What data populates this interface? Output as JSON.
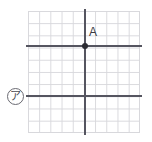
{
  "figure": {
    "grid": {
      "columns": 10,
      "rows": 10,
      "grid_line_color": "#d8d8dc",
      "axis_line_color": "#555560",
      "background": "#ffffff"
    },
    "point": {
      "label": "A",
      "marker_color": "#2b2b32",
      "grid_x": 5,
      "grid_y": 3
    },
    "marker": {
      "label": "ア",
      "description": "circled-katakana-a",
      "row": 7
    },
    "lines": [
      {
        "name": "horizontal-axis-through-point",
        "orientation": "horizontal",
        "grid_y": 3
      },
      {
        "name": "horizontal-line-lower",
        "orientation": "horizontal",
        "grid_y": 7
      },
      {
        "name": "vertical-axis-through-point",
        "orientation": "vertical",
        "grid_x": 5
      }
    ]
  },
  "chart_data": {
    "type": "scatter",
    "title": "",
    "xlabel": "",
    "ylabel": "",
    "xlim": [
      0,
      10
    ],
    "ylim": [
      0,
      10
    ],
    "grid": true,
    "legend": null,
    "points": [
      {
        "label": "A",
        "x": 5,
        "y": 7
      }
    ],
    "reference_lines": [
      {
        "type": "horizontal",
        "y": 7,
        "label": ""
      },
      {
        "type": "horizontal",
        "y": 3,
        "label": "ア"
      },
      {
        "type": "vertical",
        "x": 5,
        "label": ""
      }
    ],
    "annotations": [
      {
        "text": "A",
        "x": 5,
        "y": 7
      },
      {
        "text": "ア",
        "x": -1,
        "y": 3
      }
    ]
  }
}
